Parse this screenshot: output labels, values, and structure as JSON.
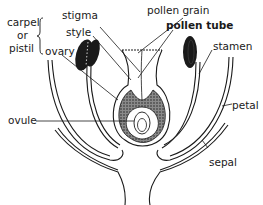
{
  "diagram": {
    "labels": {
      "carpel": "carpel",
      "or": "or",
      "pistil": "pistil",
      "stigma": "stigma",
      "style": "style",
      "ovary": "ovary",
      "pollen_grain": "pollen grain",
      "pollen_tube": "pollen tube",
      "stamen": "stamen",
      "petal": "petal",
      "ovule": "ovule",
      "sepal": "sepal"
    },
    "colors": {
      "ink": "#1a1a1a",
      "stipple": "#555555",
      "background": "#ffffff"
    }
  }
}
